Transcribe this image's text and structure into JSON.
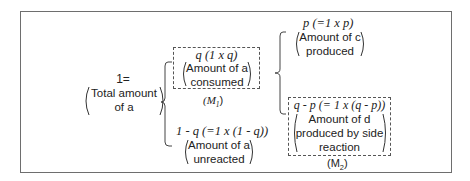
{
  "diagram": {
    "root": {
      "equation": "1=",
      "description_line1": "Total amount",
      "description_line2": "of a"
    },
    "consumed": {
      "formula": "q (1 x q)",
      "description_line1": "Amount of a",
      "description_line2": "consumed",
      "label": "(M",
      "label_sub": "1",
      "label_close": ")"
    },
    "unreacted": {
      "formula": "1 - q (=1 x (1 - q))",
      "description_line1": "Amount of a",
      "description_line2": "unreacted"
    },
    "product_c": {
      "formula": "p (=1 x p)",
      "description_line1": "Amount of c",
      "description_line2": "produced"
    },
    "side_product_d": {
      "formula": "q - p (= 1 x (q - p))",
      "description_line1": "Amount of d",
      "description_line2": "produced by side",
      "description_line3": "reaction",
      "label": "(M",
      "label_sub": "2",
      "label_close": ")"
    }
  },
  "colors": {
    "frame_border": "#6e6e6e",
    "text": "#222222",
    "dashed_border": "#555555"
  }
}
